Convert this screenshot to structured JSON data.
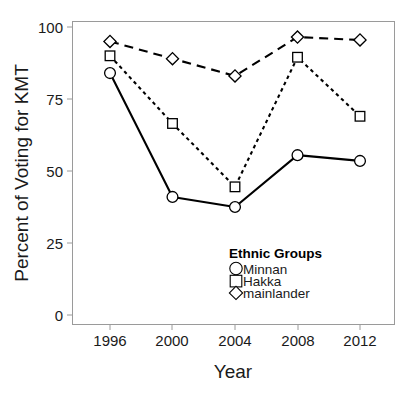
{
  "figure": {
    "top_artifact_text": "",
    "background_color": "#ffffff",
    "frame_color": "#9a9a9a",
    "ink_color": "#000000"
  },
  "axes": {
    "y_title": "Percent of Voting for KMT",
    "x_title": "Year",
    "y_ticks": [
      "0",
      "25",
      "50",
      "75",
      "100"
    ],
    "x_ticks": [
      "1996",
      "2000",
      "2004",
      "2008",
      "2012"
    ]
  },
  "legend": {
    "title": "Ethnic Groups",
    "entries": [
      {
        "label": "Minnan",
        "marker": "circle-marker",
        "line": "solid"
      },
      {
        "label": "Hakka",
        "marker": "square-marker",
        "line": "dotted"
      },
      {
        "label": "mainlander",
        "marker": "diamond-marker",
        "line": "dashed"
      }
    ]
  },
  "chart_data": {
    "type": "line",
    "title": "",
    "xlabel": "Year",
    "ylabel": "Percent of Voting for KMT",
    "categories": [
      "1996",
      "2000",
      "2004",
      "2008",
      "2012"
    ],
    "x": [
      1996,
      2000,
      2004,
      2008,
      2012
    ],
    "ylim": [
      0,
      100
    ],
    "yticks": [
      0,
      25,
      50,
      75,
      100
    ],
    "grid": false,
    "legend_position": "inside-lower-right",
    "series": [
      {
        "name": "Minnan",
        "marker": "circle",
        "linestyle": "solid",
        "color": "#000000",
        "values": [
          84,
          41,
          37.5,
          55.5,
          53.5
        ]
      },
      {
        "name": "Hakka",
        "marker": "square",
        "linestyle": "dotted",
        "color": "#000000",
        "values": [
          90,
          66.5,
          44.5,
          89.5,
          69
        ]
      },
      {
        "name": "mainlander",
        "marker": "diamond",
        "linestyle": "dashed",
        "color": "#000000",
        "values": [
          95,
          89,
          83,
          96.5,
          95.5
        ]
      }
    ]
  }
}
